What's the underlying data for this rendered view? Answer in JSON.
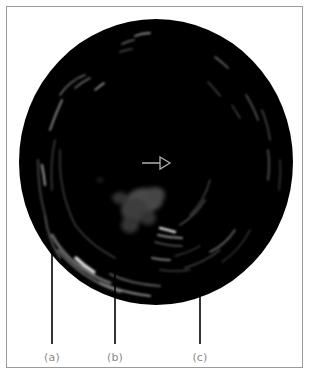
{
  "figure": {
    "background_color": "#ffffff",
    "image_color": "#000000",
    "echo_color": "#c8c8c8",
    "arrow_color": "#b0b0b0",
    "label_color": "#8a8a8a",
    "leader_line_color": "#000000",
    "center_marker": "arrow-right-icon",
    "labels": [
      {
        "id": "a",
        "text": "(a)"
      },
      {
        "id": "b",
        "text": "(b)"
      },
      {
        "id": "c",
        "text": "(c)"
      }
    ]
  }
}
